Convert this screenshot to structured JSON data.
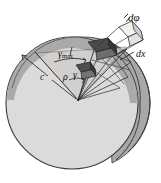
{
  "figure": {
    "type": "engineering-diagram",
    "width": 161,
    "height": 183,
    "background_color": "#ffffff"
  },
  "labels": {
    "d_phi": "dφ",
    "dx": "dx",
    "gamma_max_symbol": "γ",
    "gamma_max_subscript": "max",
    "radius_c": "c",
    "rho": "ρ",
    "gamma": "γ"
  },
  "colors": {
    "disc_face": "#dcdbd9",
    "disc_band": "#a9a8a6",
    "disc_band_dark": "#8e8d8b",
    "outline": "#3a3a3a",
    "element_dark": "#4a4a4a",
    "element_mid": "#6e6e6e",
    "element_light": "#b9b8b6",
    "wedge_fill": "#c9c8c6",
    "label_text": "#151515"
  },
  "geometry": {
    "disc_center_x": 72,
    "disc_center_y": 103,
    "disc_radius": 66,
    "apex_x": 78,
    "apex_y": 100,
    "outer_radius_label": "c",
    "inner_radius_label": "ρ"
  },
  "elements": [
    {
      "name": "outer-surface-element",
      "shade": "dark",
      "note": "shear element at radius c"
    },
    {
      "name": "inner-surface-element",
      "shade": "mid",
      "note": "shear element at radius rho"
    },
    {
      "name": "detail-callout-element",
      "shade": "light",
      "note": "enlarged element at top right"
    }
  ]
}
